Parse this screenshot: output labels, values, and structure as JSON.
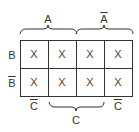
{
  "kmap": {
    "top_labels": [
      {
        "text": "A",
        "bar": false
      },
      {
        "text": "A",
        "bar": true
      }
    ],
    "row_labels": [
      {
        "text": "B",
        "bar": false
      },
      {
        "text": "B",
        "bar": true
      }
    ],
    "bottom_labels": [
      {
        "text": "C",
        "bar": true
      },
      {
        "text": "C",
        "bar": false
      },
      {
        "text": "C",
        "bar": true
      }
    ],
    "cells": [
      [
        "X",
        "X",
        "X",
        "X"
      ],
      [
        "X",
        "X",
        "X",
        "X"
      ]
    ],
    "line_color": "#333333"
  }
}
